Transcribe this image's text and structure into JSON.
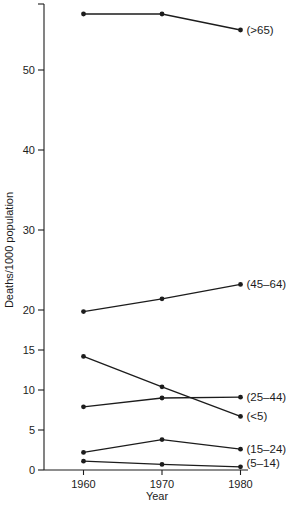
{
  "chart_data": {
    "type": "line",
    "title": "",
    "xlabel": "Year",
    "ylabel": "Deaths/1000 population",
    "x": [
      1960,
      1970,
      1980
    ],
    "xticks": [
      "1960",
      "1970",
      "1980"
    ],
    "yticks": [
      0,
      5,
      10,
      15,
      20,
      30,
      40,
      50
    ],
    "ylim": [
      0,
      58.3
    ],
    "grid": false,
    "legend_position": "right-end-of-line",
    "line_color": "#1c1c1c",
    "marker": "filled-circle",
    "series": [
      {
        "name": "(>65)",
        "values": [
          57.0,
          57.0,
          55.0
        ]
      },
      {
        "name": "(45–64)",
        "values": [
          19.8,
          21.4,
          23.2
        ]
      },
      {
        "name": "(<5)",
        "values": [
          14.2,
          10.4,
          6.7
        ]
      },
      {
        "name": "(25–44)",
        "values": [
          7.9,
          9.0,
          9.1
        ]
      },
      {
        "name": "(15–24)",
        "values": [
          2.2,
          3.8,
          2.6
        ]
      },
      {
        "name": "(5–14)",
        "values": [
          1.1,
          0.7,
          0.4
        ]
      }
    ]
  }
}
